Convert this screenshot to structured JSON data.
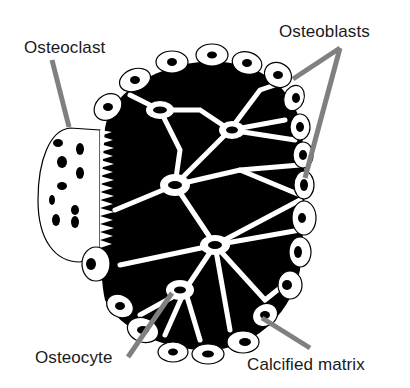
{
  "diagram": {
    "labels": {
      "osteoclast": "Osteoclast",
      "osteoblasts": "Osteoblasts",
      "osteocyte": "Osteocyte",
      "calcified_matrix": "Calcified matrix"
    },
    "colors": {
      "matrix": "#000000",
      "cell_fill": "#ffffff",
      "leader_line": "#808080",
      "text": "#1a1a1a"
    }
  }
}
